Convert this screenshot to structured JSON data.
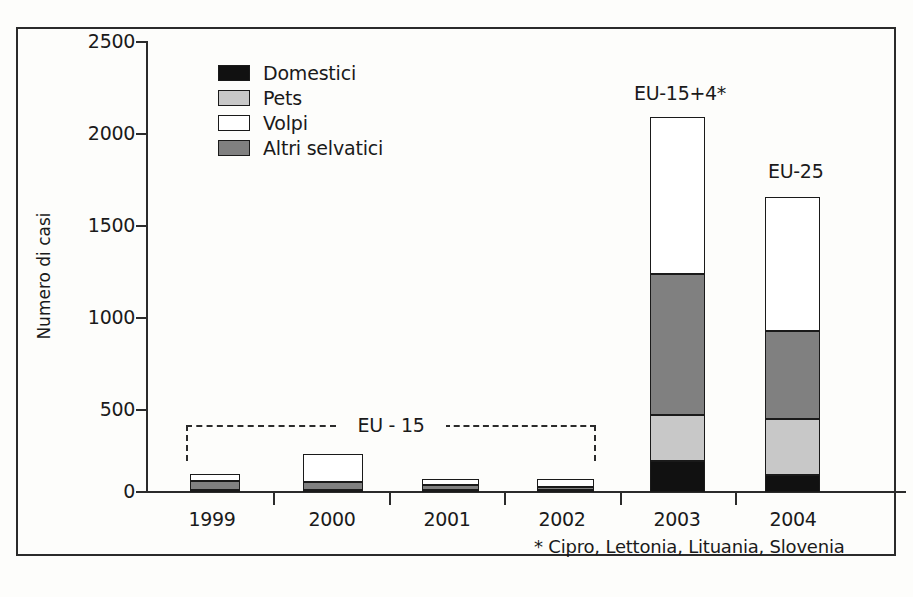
{
  "chart_data": {
    "type": "bar",
    "subtype": "stacked-vertical",
    "title": "",
    "xlabel": "",
    "ylabel": "Numero di casi",
    "categories": [
      "1999",
      "2000",
      "2001",
      "2002",
      "2003",
      "2004"
    ],
    "ylim": [
      0,
      2500
    ],
    "yticks": [
      0,
      500,
      1000,
      1500,
      2000,
      2500
    ],
    "grid": false,
    "legend_position": "top-left",
    "series": [
      {
        "name": "Domestici",
        "color": "#111111",
        "values": [
          5,
          5,
          5,
          5,
          170,
          95
        ]
      },
      {
        "name": "Pets",
        "color": "#c8c8c8",
        "values": [
          5,
          5,
          5,
          5,
          255,
          310
        ]
      },
      {
        "name": "Volpi",
        "color": "#ffffff",
        "values": [
          40,
          155,
          30,
          40,
          870,
          745
        ]
      },
      {
        "name": "Altri selvatici",
        "color": "#808080",
        "values": [
          50,
          45,
          30,
          20,
          785,
          485
        ]
      }
    ],
    "stack_order_bottom_to_top": [
      "Domestici",
      "Pets",
      "Altri selvatici",
      "Volpi"
    ],
    "bar_totals": [
      100,
      210,
      70,
      70,
      2080,
      1635
    ],
    "annotations": [
      {
        "text": "EU - 15",
        "type": "bracket",
        "spans": [
          "1999",
          "2002"
        ]
      },
      {
        "text": "EU-15+4*",
        "type": "label",
        "over": "2003"
      },
      {
        "text": "EU-25",
        "type": "label",
        "over": "2004"
      }
    ],
    "footnote": "* Cipro, Lettonia, Lituania, Slovenia"
  },
  "axis": {
    "ylabel": "Numero di casi",
    "yticks": [
      "2500",
      "2000",
      "1500",
      "1000",
      "500",
      "0"
    ],
    "xticks": [
      "1999",
      "2000",
      "2001",
      "2002",
      "2003",
      "2004"
    ]
  },
  "legend": {
    "items": [
      {
        "label": "Domestici",
        "color": "#111111"
      },
      {
        "label": "Pets",
        "color": "#c8c8c8"
      },
      {
        "label": "Volpi",
        "color": "#ffffff"
      },
      {
        "label": "Altri selvatici",
        "color": "#808080"
      }
    ]
  },
  "annotations": {
    "eu15_bracket": "EU - 15",
    "eu15_plus4": "EU-15+4*",
    "eu25": "EU-25",
    "footnote": "* Cipro, Lettonia, Lituania, Slovenia"
  }
}
